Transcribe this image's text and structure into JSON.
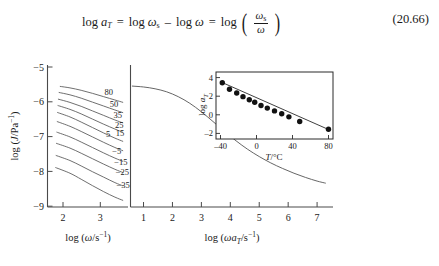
{
  "equation": {
    "lhs": "log",
    "lhs_var": "a",
    "lhs_sub": "T",
    "eq1": "=",
    "t1": "log",
    "t1_var": "ω",
    "t1_sub": "s",
    "minus": "–",
    "t2": "log",
    "t2_var": "ω",
    "eq2": "=",
    "t3": "log",
    "frac_num_var": "ω",
    "frac_num_sub": "s",
    "frac_den_var": "ω",
    "number": "(20.66)"
  },
  "chart_data": [
    {
      "type": "line",
      "name": "isotherms-panel",
      "title": "",
      "xlabel": "log (ω/s⁻¹)",
      "ylabel": "log (J/Pa⁻¹)",
      "xlim": [
        1.6,
        3.75
      ],
      "ylim": [
        -9.4,
        -4.8
      ],
      "xticks": [
        2,
        3
      ],
      "yticks": [
        -5,
        -6,
        -7,
        -8,
        -9
      ],
      "xtick_labels": [
        "2",
        "3"
      ],
      "ytick_labels": [
        "−5",
        "−6",
        "−7",
        "−8",
        "−9"
      ],
      "grid": false,
      "legend": "inline-curve-labels",
      "series_label_unit": "°C",
      "series": [
        {
          "name": "80",
          "label": "80",
          "label_x": 3.12,
          "label_y": -5.62,
          "values": [
            [
              1.93,
              -5.44
            ],
            [
              2.2,
              -5.49
            ],
            [
              2.5,
              -5.57
            ],
            [
              2.8,
              -5.67
            ],
            [
              3.1,
              -5.78
            ],
            [
              3.4,
              -5.89
            ],
            [
              3.62,
              -5.97
            ]
          ]
        },
        {
          "name": "50",
          "label": "50",
          "label_x": 3.26,
          "label_y": -6.02,
          "values": [
            [
              1.9,
              -5.64
            ],
            [
              2.2,
              -5.72
            ],
            [
              2.5,
              -5.83
            ],
            [
              2.8,
              -5.96
            ],
            [
              3.1,
              -6.09
            ],
            [
              3.4,
              -6.22
            ],
            [
              3.62,
              -6.31
            ]
          ]
        },
        {
          "name": "35",
          "label": "35",
          "label_x": 3.36,
          "label_y": -6.4,
          "values": [
            [
              1.88,
              -5.86
            ],
            [
              2.2,
              -5.97
            ],
            [
              2.5,
              -6.1
            ],
            [
              2.8,
              -6.25
            ],
            [
              3.1,
              -6.4
            ],
            [
              3.4,
              -6.55
            ],
            [
              3.62,
              -6.65
            ]
          ]
        },
        {
          "name": "25",
          "label": "25",
          "label_x": 3.4,
          "label_y": -6.72,
          "values": [
            [
              1.87,
              -6.07
            ],
            [
              2.2,
              -6.2
            ],
            [
              2.5,
              -6.35
            ],
            [
              2.8,
              -6.52
            ],
            [
              3.1,
              -6.69
            ],
            [
              3.4,
              -6.85
            ],
            [
              3.62,
              -6.96
            ]
          ]
        },
        {
          "name": "15",
          "label": "15",
          "label_x": 3.42,
          "label_y": -6.99,
          "values": [
            [
              1.86,
              -6.3
            ],
            [
              2.2,
              -6.45
            ],
            [
              2.5,
              -6.62
            ],
            [
              2.8,
              -6.8
            ],
            [
              3.1,
              -6.98
            ],
            [
              3.4,
              -7.15
            ],
            [
              3.62,
              -7.26
            ]
          ]
        },
        {
          "name": "5",
          "label": "5",
          "label_x": 3.16,
          "label_y": -7.02,
          "values": [
            [
              1.85,
              -6.6
            ],
            [
              2.2,
              -6.76
            ],
            [
              2.5,
              -6.93
            ],
            [
              2.8,
              -7.11
            ],
            [
              3.1,
              -7.29
            ],
            [
              3.4,
              -7.46
            ],
            [
              3.62,
              -7.57
            ]
          ]
        },
        {
          "name": "-5",
          "label": "−5",
          "label_x": 3.33,
          "label_y": -7.56,
          "values": [
            [
              1.84,
              -6.95
            ],
            [
              2.2,
              -7.11
            ],
            [
              2.5,
              -7.28
            ],
            [
              2.8,
              -7.46
            ],
            [
              3.1,
              -7.64
            ],
            [
              3.4,
              -7.81
            ],
            [
              3.62,
              -7.92
            ]
          ]
        },
        {
          "name": "-15",
          "label": "−15",
          "label_x": 3.38,
          "label_y": -7.93,
          "values": [
            [
              1.83,
              -7.32
            ],
            [
              2.2,
              -7.48
            ],
            [
              2.5,
              -7.65
            ],
            [
              2.8,
              -7.83
            ],
            [
              3.1,
              -8.01
            ],
            [
              3.4,
              -8.18
            ],
            [
              3.62,
              -8.29
            ]
          ]
        },
        {
          "name": "-25",
          "label": "−25",
          "label_x": 3.42,
          "label_y": -8.27,
          "values": [
            [
              1.82,
              -7.72
            ],
            [
              2.2,
              -7.89
            ],
            [
              2.5,
              -8.07
            ],
            [
              2.8,
              -8.26
            ],
            [
              3.1,
              -8.44
            ],
            [
              3.4,
              -8.62
            ],
            [
              3.62,
              -8.73
            ]
          ]
        },
        {
          "name": "-35",
          "label": "−35",
          "label_x": 3.44,
          "label_y": -8.7,
          "values": [
            [
              1.81,
              -8.12
            ],
            [
              2.2,
              -8.31
            ],
            [
              2.5,
              -8.51
            ],
            [
              2.8,
              -8.72
            ],
            [
              3.1,
              -8.92
            ],
            [
              3.4,
              -9.1
            ],
            [
              3.62,
              -9.21
            ]
          ]
        }
      ]
    },
    {
      "type": "line",
      "name": "master-curve-panel",
      "title": "",
      "xlabel": "log (ωa_T/s⁻¹)",
      "ylabel": "",
      "xlim": [
        0.55,
        7.55
      ],
      "ylim": [
        -9.4,
        -4.8
      ],
      "xticks": [
        1,
        2,
        3,
        4,
        5,
        6,
        7
      ],
      "xtick_labels": [
        "1",
        "2",
        "3",
        "4",
        "5",
        "6",
        "7"
      ],
      "grid": false,
      "series": [
        {
          "name": "master",
          "values": [
            [
              0.6,
              -5.43
            ],
            [
              1.0,
              -5.46
            ],
            [
              1.4,
              -5.52
            ],
            [
              1.8,
              -5.62
            ],
            [
              2.2,
              -5.78
            ],
            [
              2.6,
              -6.0
            ],
            [
              3.0,
              -6.28
            ],
            [
              3.4,
              -6.6
            ],
            [
              3.8,
              -6.93
            ],
            [
              4.2,
              -7.24
            ],
            [
              4.6,
              -7.52
            ],
            [
              5.0,
              -7.76
            ],
            [
              5.4,
              -7.97
            ],
            [
              5.8,
              -8.15
            ],
            [
              6.2,
              -8.31
            ],
            [
              6.6,
              -8.45
            ],
            [
              7.0,
              -8.57
            ],
            [
              7.3,
              -8.64
            ]
          ]
        }
      ]
    },
    {
      "type": "scatter",
      "name": "shift-factor-inset",
      "title": "",
      "xlabel": "T/°C",
      "ylabel": "log a_T",
      "xlim": [
        -45,
        85
      ],
      "ylim": [
        -2.6,
        4.6
      ],
      "xticks": [
        -40,
        0,
        40,
        80
      ],
      "yticks": [
        4,
        2,
        0,
        -2
      ],
      "xtick_labels": [
        "–40",
        "0",
        "40",
        "80"
      ],
      "ytick_labels": [
        "4",
        "2",
        "0",
        "–2"
      ],
      "grid": false,
      "x": [
        -38,
        -30,
        -22,
        -15,
        -8,
        -2,
        5,
        12,
        20,
        28,
        36,
        48,
        80
      ],
      "y": [
        3.45,
        2.75,
        2.35,
        1.95,
        1.62,
        1.35,
        1.0,
        0.72,
        0.42,
        0.12,
        -0.22,
        -0.72,
        -1.55
      ],
      "fit_line": [
        [
          -40,
          3.55
        ],
        [
          80,
          -1.58
        ]
      ]
    }
  ]
}
